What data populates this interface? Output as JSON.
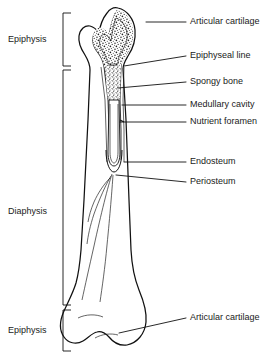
{
  "figure": {
    "background_color": "#ffffff",
    "ink_color": "#111111"
  },
  "left_brackets": [
    {
      "id": "epiphysis-proximal",
      "label": "Epiphysis",
      "y_top": 13,
      "y_bottom": 66,
      "label_y": 40
    },
    {
      "id": "diaphysis",
      "label": "Diaphysis",
      "y_top": 70,
      "y_bottom": 305,
      "label_y": 212
    },
    {
      "id": "epiphysis-distal",
      "label": "Epiphysis",
      "y_top": 310,
      "y_bottom": 351,
      "label_y": 331
    }
  ],
  "callouts": [
    {
      "id": "articular-cartilage-proximal",
      "label": "Articular cartilage",
      "text_x": 190,
      "text_y": 22,
      "line": "M186,22 L146,22"
    },
    {
      "id": "epiphyseal-line",
      "label": "Epiphyseal line",
      "text_x": 190,
      "text_y": 56,
      "line": "M186,56 L124,66"
    },
    {
      "id": "spongy-bone",
      "label": "Spongy bone",
      "text_x": 190,
      "text_y": 82,
      "line": "M186,82 L118,88"
    },
    {
      "id": "medullary-cavity",
      "label": "Medullary cavity",
      "text_x": 190,
      "text_y": 105,
      "line": "M186,105 L122,105"
    },
    {
      "id": "nutrient-foramen",
      "label": "Nutrient foramen",
      "text_x": 190,
      "text_y": 122,
      "line": "M186,122 L120,122"
    },
    {
      "id": "endosteum",
      "label": "Endosteum",
      "text_x": 190,
      "text_y": 162,
      "line": "M186,162 L124,162"
    },
    {
      "id": "periosteum",
      "label": "Periosteum",
      "text_x": 190,
      "text_y": 182,
      "line": "M186,182 L116,175"
    },
    {
      "id": "articular-cartilage-distal",
      "label": "Articular cartilage",
      "text_x": 190,
      "text_y": 318,
      "line": "M186,318 L119,333"
    }
  ],
  "bone_regions": [
    {
      "id": "proximal-head",
      "name": "Proximal epiphysis with articular cartilage and spongy bone"
    },
    {
      "id": "epiphyseal-plate",
      "name": "Epiphyseal line"
    },
    {
      "id": "spongy-region",
      "name": "Spongy (cancellous) bone stipple"
    },
    {
      "id": "marrow-cavity",
      "name": "Medullary cavity"
    },
    {
      "id": "compact-wall",
      "name": "Compact bone wall"
    },
    {
      "id": "periosteum-flap",
      "name": "Peeled periosteum flap"
    },
    {
      "id": "distal-condyles",
      "name": "Distal epiphysis condyles"
    }
  ]
}
